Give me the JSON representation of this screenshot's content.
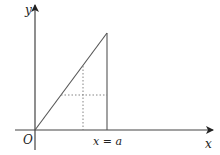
{
  "diagram": {
    "type": "geometry-graph",
    "width": 220,
    "height": 155,
    "colors": {
      "axis": "#444444",
      "line": "#555555",
      "dotted": "#777777",
      "text": "#222222"
    },
    "labels": {
      "y_axis": "y",
      "x_axis": "x",
      "origin": "O",
      "boundary": "x = a"
    },
    "geometry": {
      "origin": [
        35,
        130
      ],
      "x_axis": {
        "from": [
          15,
          130
        ],
        "to": [
          213,
          130
        ]
      },
      "y_axis": {
        "from": [
          35,
          150
        ],
        "to": [
          35,
          5
        ]
      },
      "diagonal": {
        "from": [
          35,
          130
        ],
        "to": [
          107,
          33
        ]
      },
      "vertical_line": {
        "x": 107,
        "from_y": 33,
        "to_y": 130
      },
      "dotted_vertical": {
        "x": 83,
        "from_y": 66,
        "to_y": 130
      },
      "dotted_horizontal": {
        "y": 95,
        "from_x": 61,
        "to_x": 107
      }
    }
  }
}
